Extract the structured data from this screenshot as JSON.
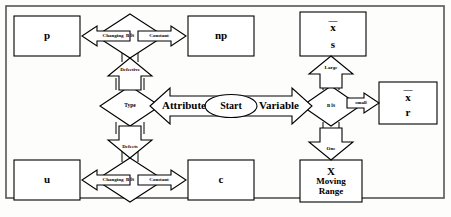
{
  "diagram": {
    "type": "flowchart",
    "start": {
      "label": "Start"
    },
    "branches": {
      "left_label": "Attribute",
      "right_label": "Variable"
    },
    "decisions": [
      {
        "id": "type",
        "label": "Type"
      },
      {
        "id": "n-is-top",
        "label": "n is"
      },
      {
        "id": "n-is-bottom",
        "label": "n is"
      },
      {
        "id": "n-is-right",
        "label": "n is"
      }
    ],
    "arrows": [
      {
        "id": "defective",
        "label": "Defective"
      },
      {
        "id": "defects",
        "label": "Defects"
      },
      {
        "id": "changing-top",
        "label": "Changing"
      },
      {
        "id": "constant-top",
        "label": "Constant"
      },
      {
        "id": "changing-bottom",
        "label": "Changing"
      },
      {
        "id": "constant-bottom",
        "label": "Constant"
      },
      {
        "id": "large",
        "label": "Large"
      },
      {
        "id": "small",
        "label": "small"
      },
      {
        "id": "one",
        "label": "One"
      }
    ],
    "charts": [
      {
        "id": "p",
        "line1": "p",
        "line2": "",
        "line3": ""
      },
      {
        "id": "np",
        "line1": "np",
        "line2": "",
        "line3": ""
      },
      {
        "id": "u",
        "line1": "u",
        "line2": "",
        "line3": ""
      },
      {
        "id": "c",
        "line1": "c",
        "line2": "",
        "line3": ""
      },
      {
        "id": "xbar-s",
        "line1": "x",
        "line2": "s",
        "line3": ""
      },
      {
        "id": "xbar-r",
        "line1": "x",
        "line2": "r",
        "line3": ""
      },
      {
        "id": "x-moving-range",
        "line1": "X",
        "line2": "Moving",
        "line3": "Range"
      }
    ],
    "colors": {
      "stroke": "#000000",
      "fill": "#ffffff",
      "background": "#fdfdfb"
    }
  }
}
